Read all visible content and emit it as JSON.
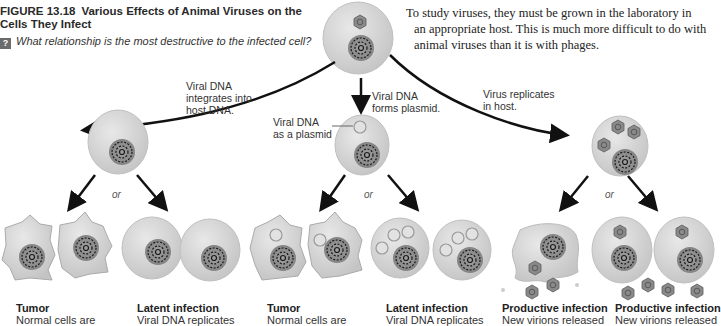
{
  "figure": {
    "number": "FIGURE 13.18",
    "title": "Various Effects of Animal Viruses on the Cells They Infect",
    "question_icon": "question-icon",
    "question": "What relationship is the most destructive to the infected cell?"
  },
  "body_text": {
    "lines": [
      "To study viruses, they must be grown in the laboratory in",
      "an appropriate host. This is much more difficult to do with",
      "animal viruses than it is with phages."
    ]
  },
  "pathways": {
    "left": {
      "label_lines": [
        "Viral DNA",
        "integrates into",
        "host DNA."
      ]
    },
    "middle": {
      "label_lines": [
        "Viral DNA",
        "forms plasmid."
      ],
      "callout_lines": [
        "Viral DNA",
        "as a plasmid"
      ]
    },
    "right": {
      "label_lines": [
        "Virus replicates",
        "in host."
      ]
    }
  },
  "or_label": "or",
  "outcomes": [
    {
      "title": "Tumor",
      "desc": "Normal cells are"
    },
    {
      "title": "Latent infection",
      "desc": "Viral DNA replicates"
    },
    {
      "title": "Tumor",
      "desc": "Normal cells are"
    },
    {
      "title": "Latent infection",
      "desc": "Viral DNA replicates"
    },
    {
      "title": "Productive infection",
      "desc": "New virions released"
    },
    {
      "title": "Productive infection",
      "desc": "New virions released"
    }
  ],
  "colors": {
    "cell_fill": "#d6d6d6",
    "cell_edge": "#bdbdbd",
    "nucleus": "#8f8f8f",
    "virion": "#8a8a8a",
    "arrow": "#111111"
  }
}
